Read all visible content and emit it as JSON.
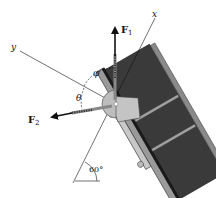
{
  "figure": {
    "type": "statics force diagram",
    "labels": {
      "force1": "F",
      "force1_sub": "1",
      "force2": "F",
      "force2_sub": "2",
      "x_axis": "x",
      "y_axis": "y",
      "angle_phi": "φ",
      "angle_theta": "θ",
      "angle_incline": "60°"
    },
    "colors": {
      "line": "#111111",
      "beam_dark": "#3a3a3a",
      "beam_flange": "#8a8a8a",
      "plate": "#b5b5b5",
      "bracket": "#cfcfcf"
    }
  }
}
